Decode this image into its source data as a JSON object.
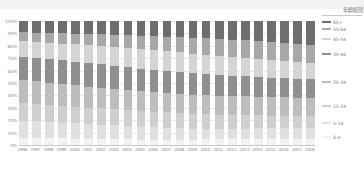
{
  "chart_data": {
    "type": "bar",
    "stacked": true,
    "normalized": "100%",
    "title": "",
    "subtitle": "",
    "xlabel": "",
    "ylabel": "",
    "ylim": [
      0,
      100
    ],
    "grid": true,
    "legend_position": "right",
    "legend_title": "年齡組別",
    "categories": [
      "1996",
      "1997",
      "1998",
      "1999",
      "2000",
      "2001",
      "2002",
      "2003",
      "2004",
      "2005",
      "2006",
      "2007",
      "2008",
      "2009",
      "2010",
      "2011",
      "2012",
      "2013",
      "2014",
      "2015",
      "2016",
      "2017",
      "2018"
    ],
    "ytick_labels": [
      "100%",
      "90%",
      "80%",
      "70%",
      "60%",
      "50%",
      "40%",
      "30%",
      "20%",
      "10%",
      "0%"
    ],
    "ytick_values": [
      100,
      90,
      80,
      70,
      60,
      50,
      40,
      30,
      20,
      10,
      0
    ],
    "series": [
      {
        "name": "0-4",
        "color": "#f2f2f2",
        "values": [
          6.0,
          5.8,
          5.6,
          5.4,
          5.2,
          5.0,
          4.8,
          4.7,
          4.5,
          4.4,
          4.3,
          4.3,
          4.4,
          4.4,
          4.5,
          4.6,
          4.8,
          4.9,
          4.9,
          4.9,
          4.8,
          4.7,
          4.6
        ]
      },
      {
        "name": "5-14",
        "color": "#e0e0e0",
        "values": [
          13.5,
          13.2,
          12.9,
          12.6,
          12.3,
          12.0,
          11.6,
          11.2,
          10.8,
          10.4,
          10.0,
          9.6,
          9.2,
          8.9,
          8.7,
          8.5,
          8.4,
          8.4,
          8.5,
          8.6,
          8.8,
          9.0,
          9.1
        ]
      },
      {
        "name": "15-24",
        "color": "#cfcfcf",
        "values": [
          14.0,
          13.8,
          13.6,
          13.4,
          13.3,
          13.2,
          13.1,
          13.0,
          12.9,
          12.8,
          12.7,
          12.5,
          12.3,
          12.0,
          11.7,
          11.4,
          11.1,
          10.8,
          10.5,
          10.2,
          10.0,
          9.8,
          9.6
        ]
      },
      {
        "name": "25-34",
        "color": "#bdbdbd",
        "values": [
          19.0,
          18.6,
          18.2,
          17.8,
          17.4,
          17.0,
          16.6,
          16.3,
          16.0,
          15.8,
          15.6,
          15.5,
          15.4,
          15.4,
          15.4,
          15.4,
          15.4,
          15.3,
          15.2,
          15.0,
          14.8,
          14.6,
          14.4
        ]
      },
      {
        "name": "35-44",
        "color": "#8f8f8f",
        "values": [
          18.5,
          18.7,
          18.9,
          19.0,
          19.1,
          19.1,
          19.0,
          18.8,
          18.6,
          18.3,
          18.0,
          17.7,
          17.4,
          17.1,
          16.8,
          16.5,
          16.2,
          16.0,
          15.8,
          15.6,
          15.5,
          15.4,
          15.3
        ]
      },
      {
        "name": "45-54",
        "color": "#d4d4d4",
        "values": [
          12.5,
          12.9,
          13.3,
          13.7,
          14.1,
          14.5,
          14.9,
          15.2,
          15.5,
          15.7,
          15.9,
          16.0,
          16.0,
          15.9,
          15.8,
          15.6,
          15.3,
          15.0,
          14.7,
          14.4,
          14.1,
          13.8,
          13.5
        ]
      },
      {
        "name": "55-64",
        "color": "#a8a8a8",
        "values": [
          7.5,
          7.7,
          7.9,
          8.2,
          8.5,
          8.9,
          9.3,
          9.7,
          10.2,
          10.7,
          11.2,
          11.7,
          12.2,
          12.7,
          13.1,
          13.5,
          13.8,
          14.0,
          14.2,
          14.3,
          14.4,
          14.4,
          14.4
        ]
      },
      {
        "name": "65+",
        "color": "#6e6e6e",
        "values": [
          9.0,
          9.3,
          9.6,
          9.9,
          10.1,
          10.3,
          10.7,
          11.1,
          11.5,
          11.9,
          12.3,
          12.7,
          13.1,
          13.6,
          14.0,
          14.5,
          15.0,
          15.6,
          16.2,
          17.0,
          17.6,
          18.3,
          19.1
        ]
      }
    ],
    "legend_entries": [
      {
        "label": "65+",
        "color": "#6e6e6e"
      },
      {
        "label": "55-64",
        "color": "#a8a8a8"
      },
      {
        "label": "45-54",
        "color": "#d4d4d4"
      },
      {
        "label": "35-44",
        "color": "#8f8f8f"
      },
      {
        "label": "25-34",
        "color": "#bdbdbd"
      },
      {
        "label": "15-24",
        "color": "#cfcfcf"
      },
      {
        "label": "5-14",
        "color": "#e0e0e0"
      },
      {
        "label": "0-4",
        "color": "#f2f2f2"
      }
    ],
    "colors": {
      "gridline": "#e9e9e9",
      "axis": "#c8c8c8",
      "tick_text": "#8b8b8b",
      "legend_text": "#7d7d7d",
      "top_band": "#f2f2f2"
    }
  }
}
